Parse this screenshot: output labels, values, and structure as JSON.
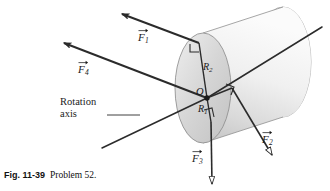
{
  "figure": {
    "caption_number": "Fig. 11-39",
    "caption_text": "Problem 52.",
    "background_color": "#ffffff",
    "line_color": "#2b2b2b",
    "cylinder_fill_light": "#f3f3f3",
    "cylinder_fill_mid": "#d8d8d8",
    "cylinder_fill_dark": "#b9b9b9"
  },
  "annotations": {
    "axis_label_line1": "Rotation",
    "axis_label_line2": "axis",
    "pivot_label": "O",
    "radius_inner_symbol": "R",
    "radius_inner_sub": "1",
    "radius_outer_symbol": "R",
    "radius_outer_sub": "2"
  },
  "forces": [
    {
      "id": "F1",
      "symbol": "F",
      "subscript": "1",
      "label_x": 138,
      "label_y": 31,
      "direction": "upper-left",
      "arrowhead": "filled",
      "applied_at": "top-of-outer-radius"
    },
    {
      "id": "F2",
      "symbol": "F",
      "subscript": "2",
      "label_x": 262,
      "label_y": 133,
      "direction": "lower-right",
      "arrowhead": "open",
      "applied_at": "right-of-center"
    },
    {
      "id": "F3",
      "symbol": "F",
      "subscript": "3",
      "label_x": 192,
      "label_y": 152,
      "direction": "down",
      "arrowhead": "open",
      "applied_at": "bottom-of-inner-radius"
    },
    {
      "id": "F4",
      "symbol": "F",
      "subscript": "4",
      "label_x": 78,
      "label_y": 63,
      "direction": "upper-left",
      "arrowhead": "filled",
      "applied_at": "center-O"
    }
  ],
  "geometry": {
    "pivot": {
      "x": 207,
      "y": 98
    },
    "cylinder_front_center": {
      "x": 203,
      "y": 88
    },
    "cylinder_rx": 28,
    "cylinder_ry": 55,
    "cylinder_back_center": {
      "x": 283,
      "y": 62
    }
  }
}
